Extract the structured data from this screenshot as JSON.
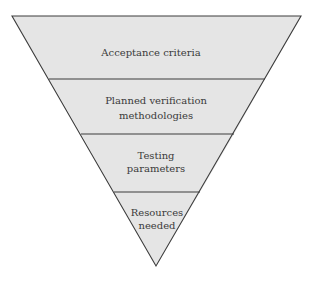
{
  "diagram": {
    "type": "inverted-pyramid",
    "fill_color": "#e5e5e5",
    "stroke_color": "#3c3c3c",
    "text_color": "#3a3a3a",
    "levels": [
      {
        "lines": [
          "Acceptance criteria"
        ]
      },
      {
        "lines": [
          "Planned verification",
          "methodologies"
        ]
      },
      {
        "lines": [
          "Testing",
          "parameters"
        ]
      },
      {
        "lines": [
          "Resources",
          "needed"
        ]
      }
    ]
  }
}
